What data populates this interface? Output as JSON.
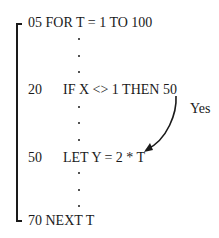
{
  "diagram": {
    "lines": [
      {
        "number": "05",
        "code": "FOR T = 1 TO 100"
      },
      {
        "number": "20",
        "code": "IF X <> 1 THEN 50"
      },
      {
        "number": "50",
        "code": "LET Y = 2 * T"
      },
      {
        "number": "70",
        "code": "NEXT T"
      }
    ],
    "arrow_label": "Yes",
    "colors": {
      "ink": "#1a1a1a",
      "background": "#ffffff"
    }
  }
}
